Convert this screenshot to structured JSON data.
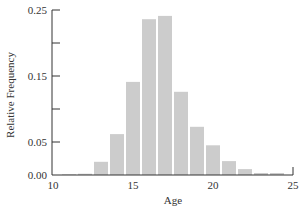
{
  "chart_data": {
    "type": "bar",
    "title": "",
    "xlabel": "Age",
    "ylabel": "Relative Frequency",
    "xlim": [
      10,
      25
    ],
    "ylim": [
      0,
      0.25
    ],
    "x_ticks": [
      10,
      15,
      20,
      25
    ],
    "x_tick_labels": [
      "10",
      "15",
      "20",
      "25"
    ],
    "y_ticks": [
      0.0,
      0.05,
      0.1,
      0.15,
      0.2,
      0.25
    ],
    "y_tick_labels": [
      "0.00",
      "0.05",
      "",
      "0.15",
      "",
      "0.25"
    ],
    "grid": false,
    "legend": null,
    "bar_width": 1,
    "bar_color": "#cccccc",
    "categories": [
      11,
      12,
      13,
      14,
      15,
      16,
      17,
      18,
      19,
      20,
      21,
      22,
      23,
      24
    ],
    "values": [
      0.001,
      0.002,
      0.02,
      0.062,
      0.141,
      0.236,
      0.241,
      0.126,
      0.073,
      0.045,
      0.021,
      0.009,
      0.003,
      0.003
    ]
  },
  "axes": {
    "x_label": "Age",
    "y_label": "Relative Frequency"
  }
}
